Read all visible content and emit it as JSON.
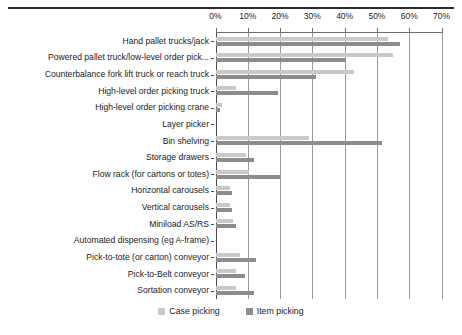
{
  "chart_data": {
    "type": "bar",
    "orientation": "horizontal",
    "title": "",
    "xlabel": "",
    "ylabel": "",
    "xlim": [
      0,
      70
    ],
    "xticks": [
      0,
      10,
      20,
      30,
      40,
      50,
      60,
      70
    ],
    "xtick_labels": [
      "0%",
      "10%",
      "20%",
      "30%",
      "40%",
      "50%",
      "60%",
      "70%"
    ],
    "grid": true,
    "grid_axis": "x",
    "legend_position": "bottom",
    "categories": [
      "Hand pallet trucks/jack",
      "Powered pallet truck/low-level order pick...",
      "Counterbalance fork lift truck or reach truck",
      "High-level order picking truck",
      "High-level order picking crane",
      "Layer picker",
      "Bin shelving",
      "Storage drawers",
      "Flow rack (for cartons or totes)",
      "Horizontal carousels",
      "Vertical carousels",
      "Miniload AS/RS",
      "Automated dispensing (eg A-frame)",
      "Pick-to-tote (or carton) conveyor",
      "Pick-to-Belt conveyor",
      "Sortation conveyor"
    ],
    "series": [
      {
        "name": "Case picking",
        "color": "#c9c9c9",
        "values": [
          53.5,
          55,
          43,
          6.5,
          2,
          0,
          29,
          9.5,
          10.5,
          4.5,
          4.5,
          5.5,
          0,
          7.5,
          6.5,
          6.5
        ]
      },
      {
        "name": "Item picking",
        "color": "#8c8c8c",
        "values": [
          57,
          40,
          31,
          19.5,
          1.5,
          0,
          51.5,
          12,
          20,
          5,
          5,
          6.5,
          0,
          12.5,
          9,
          12
        ]
      }
    ]
  },
  "legend": {
    "entries": [
      {
        "label": "Case picking",
        "swatch": "case-picking-swatch"
      },
      {
        "label": "Item picking",
        "swatch": "item-picking-swatch"
      }
    ]
  }
}
